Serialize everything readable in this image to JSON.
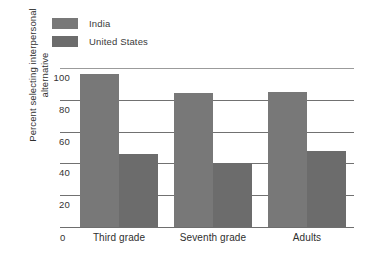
{
  "chart_data": {
    "type": "bar",
    "title": "",
    "xlabel": "",
    "ylabel_line1": "Percent selecting interpersonal",
    "ylabel_line2": "alternative",
    "categories": [
      "Third grade",
      "Seventh grade",
      "Adults"
    ],
    "series": [
      {
        "name": "India",
        "values": [
          96,
          84,
          85
        ],
        "color": "#787878"
      },
      {
        "name": "United States",
        "values": [
          46,
          40,
          48
        ],
        "color": "#6c6c6c"
      }
    ],
    "ylim": [
      0,
      100
    ],
    "yticks": [
      0,
      20,
      40,
      60,
      80,
      100
    ],
    "ytick_labels": [
      "0",
      "20",
      "40",
      "60",
      "80",
      "100"
    ],
    "origin_label": "0",
    "grid": true,
    "grid_axis": "y",
    "legend_position": "top-left"
  },
  "legend": {
    "entries": [
      {
        "label": "India"
      },
      {
        "label": "United States"
      }
    ]
  }
}
